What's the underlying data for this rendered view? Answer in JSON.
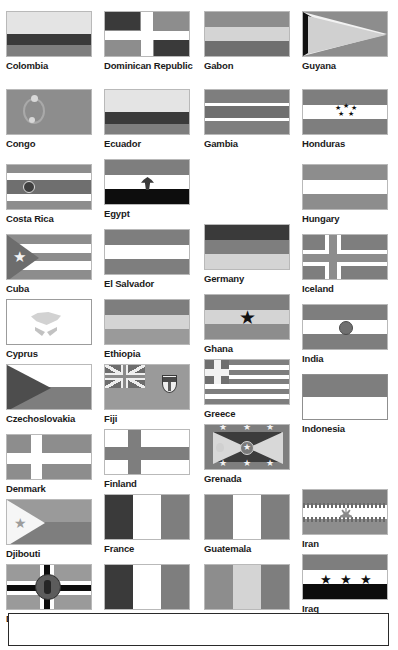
{
  "page": {
    "columns": 4,
    "bottom_note_box": ""
  },
  "colors": {
    "dark": "#3a3a3a",
    "black": "#0d0d0d",
    "mid": "#7e7e7e",
    "mid2": "#8d8d8d",
    "midlight": "#9a9a9a",
    "light": "#d4d4d4",
    "lighter": "#e4e4e4",
    "white": "#ffffff",
    "caption_text": "#1a1a1a",
    "page_background": "#ffffff",
    "border": "#b9b9b9"
  },
  "columns": [
    {
      "index": 1,
      "entries": [
        {
          "label": "Colombia",
          "top": 11,
          "type": "horizontal-tricolor-uneven"
        },
        {
          "label": "Congo",
          "top": 89,
          "type": "plain-with-emblem"
        },
        {
          "label": "Costa Rica",
          "top": 164,
          "type": "five-stripe-with-disc"
        },
        {
          "label": "Cuba",
          "top": 234,
          "type": "stripes-with-hoist-triangle-star"
        },
        {
          "label": "Cyprus",
          "top": 299,
          "type": "white-with-island-and-branches"
        },
        {
          "label": "Czechoslovakia",
          "top": 364,
          "type": "two-stripe-with-hoist-triangle"
        },
        {
          "label": "Denmark",
          "top": 434,
          "type": "nordic-cross"
        },
        {
          "label": "Djibouti",
          "top": 499,
          "type": "two-stripe-hoist-triangle-star"
        },
        {
          "label": "Dominica",
          "top": 564,
          "type": "tricolor-cross-with-central-disc"
        }
      ]
    },
    {
      "index": 2,
      "entries": [
        {
          "label": "Dominican Republic",
          "top": 11,
          "type": "quartered-cross"
        },
        {
          "label": "Ecuador",
          "top": 89,
          "type": "horizontal-tricolor-uneven"
        },
        {
          "label": "Egypt",
          "top": 159,
          "type": "horizontal-tricolor-with-eagle"
        },
        {
          "label": "El Salvador",
          "top": 229,
          "type": "horizontal-triband"
        },
        {
          "label": "Ethiopia",
          "top": 299,
          "type": "horizontal-triband"
        },
        {
          "label": "Fiji",
          "top": 364,
          "type": "ensign-with-union-jack-and-arms"
        },
        {
          "label": "Finland",
          "top": 429,
          "type": "nordic-cross"
        },
        {
          "label": "France",
          "top": 494,
          "type": "vertical-tricolor"
        },
        {
          "label": "French Guiana",
          "top": 564,
          "type": "vertical-tricolor"
        }
      ]
    },
    {
      "index": 3,
      "entries": [
        {
          "label": "Gabon",
          "top": 11,
          "type": "horizontal-triband"
        },
        {
          "label": "Gambia",
          "top": 89,
          "type": "triband-with-thin-white-fimbriations"
        },
        {
          "label": "Germany",
          "top": 224,
          "type": "horizontal-tricolor"
        },
        {
          "label": "Ghana",
          "top": 294,
          "type": "horizontal-triband-with-star"
        },
        {
          "label": "Greece",
          "top": 359,
          "type": "nine-stripes-with-canton-cross"
        },
        {
          "label": "Grenada",
          "top": 424,
          "type": "bordered-saltire-with-stars"
        },
        {
          "label": "Guatemala",
          "top": 494,
          "type": "vertical-triband"
        },
        {
          "label": "Guinea",
          "top": 564,
          "type": "vertical-tricolor"
        }
      ]
    },
    {
      "index": 4,
      "entries": [
        {
          "label": "Guyana",
          "top": 11,
          "type": "golden-arrowhead"
        },
        {
          "label": "Honduras",
          "top": 89,
          "type": "triband-with-five-stars"
        },
        {
          "label": "Hungary",
          "top": 164,
          "type": "horizontal-tricolor"
        },
        {
          "label": "Iceland",
          "top": 234,
          "type": "nordic-cross"
        },
        {
          "label": "India",
          "top": 304,
          "type": "tricolor-with-wheel"
        },
        {
          "label": "Indonesia",
          "top": 374,
          "type": "horizontal-bicolor"
        },
        {
          "label": "Iran",
          "top": 489,
          "type": "tricolor-with-emblem-and-script"
        },
        {
          "label": "Iraq",
          "top": 554,
          "type": "tricolor-with-three-stars"
        }
      ]
    }
  ]
}
